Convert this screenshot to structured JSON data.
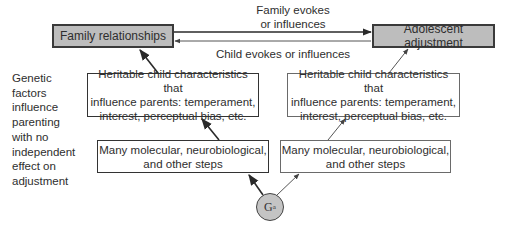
{
  "diagram": {
    "nodes": {
      "family_relationships": "Family relationships",
      "adolescent_adjustment": "Adolescent adjustment",
      "heritable_left": [
        "Heritable child characteristics that",
        "influence parents: temperament,",
        "interest, perceptual bias, etc."
      ],
      "heritable_right": [
        "Heritable child characteristics that",
        "influence parents: temperament,",
        "interest, perceptual bias, etc."
      ],
      "steps_left": [
        "Many molecular, neurobiological,",
        "and other steps"
      ],
      "steps_right": [
        "Many molecular, neurobiological,",
        "and other steps"
      ],
      "gene": {
        "symbol": "G",
        "subscript": "a"
      }
    },
    "edge_labels": {
      "family_to_adolescent": [
        "Family evokes",
        "or influences"
      ],
      "child_to_family": "Child evokes or influences"
    },
    "side_note": [
      "Genetic",
      "factors",
      "influence",
      "parenting",
      "with no",
      "independent",
      "effect on",
      "adjustment"
    ],
    "colors": {
      "box_fill_gray": "#bdbdbd",
      "gene_fill": "#c4c4c4",
      "line": "#333333"
    }
  }
}
